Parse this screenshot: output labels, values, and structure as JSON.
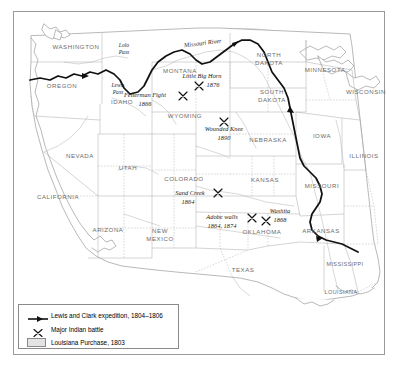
{
  "map": {
    "title": "Westward expansion map of the United States",
    "frame": {
      "visible": true,
      "border_color": "#9a9a9a"
    },
    "colors": {
      "background": "#ffffff",
      "louisiana_purchase_fill": "#e3e3e3",
      "coastline": "#8d8d8d",
      "state_border": "#a8a8a8",
      "route": "#111111",
      "state_label": "#6c6c6c",
      "battle_label": "#1c1c1c"
    },
    "states": [
      {
        "name": "WASHINGTON",
        "x": 76,
        "y": 49
      },
      {
        "name": "OREGON",
        "x": 62,
        "y": 88
      },
      {
        "name": "IDAHO",
        "x": 122,
        "y": 104
      },
      {
        "name": "MONTANA",
        "x": 180,
        "y": 73
      },
      {
        "name": "WYOMING",
        "x": 185,
        "y": 118
      },
      {
        "name": "NORTH",
        "x": 269,
        "y": 57
      },
      {
        "name": "DAKOTA",
        "x": 269,
        "y": 65
      },
      {
        "name": "SOUTH",
        "x": 272,
        "y": 94
      },
      {
        "name": "DAKOTA",
        "x": 272,
        "y": 102
      },
      {
        "name": "MINNESOTA",
        "x": 325,
        "y": 72
      },
      {
        "name": "WISCONSIN",
        "x": 366,
        "y": 94
      },
      {
        "name": "NEBRASKA",
        "x": 268,
        "y": 142
      },
      {
        "name": "IOWA",
        "x": 322,
        "y": 138
      },
      {
        "name": "ILLINOIS",
        "x": 364,
        "y": 158
      },
      {
        "name": "NEVADA",
        "x": 80,
        "y": 158
      },
      {
        "name": "UTAH",
        "x": 128,
        "y": 170
      },
      {
        "name": "COLORADO",
        "x": 184,
        "y": 181
      },
      {
        "name": "KANSAS",
        "x": 265,
        "y": 182
      },
      {
        "name": "MISSOURI",
        "x": 322,
        "y": 188
      },
      {
        "name": "CALIFORNIA",
        "x": 58,
        "y": 199
      },
      {
        "name": "ARIZONA",
        "x": 108,
        "y": 232
      },
      {
        "name": "NEW",
        "x": 160,
        "y": 233
      },
      {
        "name": "MEXICO",
        "x": 160,
        "y": 241
      },
      {
        "name": "OKLAHOMA",
        "x": 262,
        "y": 234
      },
      {
        "name": "ARKANSAS",
        "x": 321,
        "y": 233
      },
      {
        "name": "TEXAS",
        "x": 243,
        "y": 272
      },
      {
        "name": "MISSISSIPPI",
        "x": 345,
        "y": 266
      },
      {
        "name": "LOUISIANA",
        "x": 341,
        "y": 294
      }
    ],
    "battles": [
      {
        "name": "Little Big Horn",
        "year": "1876",
        "label_x": 202,
        "label_y": 78,
        "year_x": 213,
        "year_y": 87,
        "marker_x": 199,
        "marker_y": 86
      },
      {
        "name": "Fetterman Fight",
        "year": "1866",
        "label_x": 145,
        "label_y": 97,
        "year_x": 145,
        "year_y": 106,
        "marker_x": 183,
        "marker_y": 96
      },
      {
        "name": "Wounded Knee",
        "year": "1890",
        "label_x": 224,
        "label_y": 131,
        "year_x": 224,
        "year_y": 140,
        "marker_x": 224,
        "marker_y": 122
      },
      {
        "name": "Sand Creek",
        "year": "1864",
        "label_x": 190,
        "label_y": 195,
        "year_x": 188,
        "year_y": 204,
        "marker_x": 218,
        "marker_y": 193
      },
      {
        "name": "Adobe walls",
        "year": "1864, 1874",
        "label_x": 222,
        "label_y": 219,
        "year_x": 222,
        "year_y": 228,
        "marker_x": 252,
        "marker_y": 218
      },
      {
        "name": "Washita",
        "year": "1868",
        "label_x": 280,
        "label_y": 213,
        "year_x": 280,
        "year_y": 222,
        "marker_x": 266,
        "marker_y": 221
      }
    ],
    "features": [
      {
        "name": "Missouri River",
        "type": "river",
        "x": 203,
        "y": 45,
        "rotate": -7
      },
      {
        "name": "Lolo",
        "type": "pass",
        "x": 124,
        "y": 47
      },
      {
        "name": "Pass",
        "type": "pass",
        "x": 124,
        "y": 54
      },
      {
        "name": "Lewis",
        "type": "pass",
        "x": 118,
        "y": 87
      },
      {
        "name": "Pass",
        "type": "pass",
        "x": 118,
        "y": 94
      }
    ]
  },
  "legend": {
    "title": "Map legend",
    "items": [
      {
        "symbol": "route-line",
        "label": "Lewis and Clark expedition, 1804–1806"
      },
      {
        "symbol": "battle-x",
        "label": "Major Indian battle"
      },
      {
        "symbol": "area-swatch",
        "label": "Louisiana Purchase, 1803"
      }
    ]
  }
}
